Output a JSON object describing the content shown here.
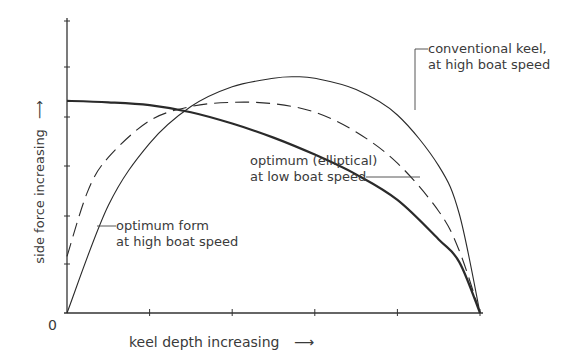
{
  "chart_data": {
    "type": "line",
    "title": "",
    "xlabel": "keel depth increasing",
    "ylabel": "side force increasing",
    "origin_label": "0",
    "axis_arrow": "⟶",
    "xlim": [
      0,
      1
    ],
    "ylim": [
      0,
      1
    ],
    "grid": false,
    "x_ticks": 5,
    "y_ticks": 6,
    "series": [
      {
        "name": "optimum (elliptical) at low boat speed",
        "style": "thick-solid",
        "x": [
          0,
          0.1,
          0.2,
          0.3,
          0.4,
          0.5,
          0.6,
          0.7,
          0.8,
          0.9,
          0.95,
          1.0
        ],
        "values": [
          0.75,
          0.745,
          0.735,
          0.71,
          0.67,
          0.62,
          0.56,
          0.49,
          0.4,
          0.26,
          0.18,
          0
        ]
      },
      {
        "name": "optimum form at high boat speed",
        "style": "thin-solid",
        "x": [
          0,
          0.1,
          0.2,
          0.3,
          0.4,
          0.5,
          0.55,
          0.6,
          0.7,
          0.8,
          0.9,
          0.95,
          1.0
        ],
        "values": [
          0,
          0.38,
          0.6,
          0.73,
          0.8,
          0.83,
          0.835,
          0.83,
          0.79,
          0.7,
          0.52,
          0.35,
          0
        ]
      },
      {
        "name": "conventional keel, at high boat speed",
        "style": "dashed",
        "x": [
          0,
          0.05,
          0.1,
          0.2,
          0.3,
          0.4,
          0.5,
          0.6,
          0.7,
          0.8,
          0.9,
          0.95,
          1.0
        ],
        "values": [
          0.2,
          0.43,
          0.55,
          0.68,
          0.73,
          0.745,
          0.74,
          0.71,
          0.64,
          0.53,
          0.36,
          0.22,
          0
        ]
      }
    ],
    "annotations": [
      {
        "line1": "conventional keel,",
        "line2": "at high boat speed"
      },
      {
        "line1": "optimum (elliptical)",
        "line2": "at low boat speed"
      },
      {
        "line1": "optimum form",
        "line2": "at high boat speed"
      }
    ]
  }
}
